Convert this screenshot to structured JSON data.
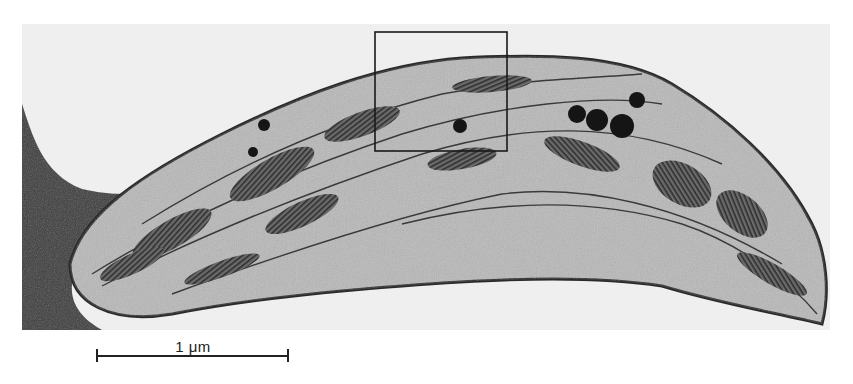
{
  "figure": {
    "inset_box": {
      "x": 375,
      "y": 32,
      "width": 132,
      "height": 119
    }
  },
  "scale_bar": {
    "label": "1 μm",
    "length_px": 192
  },
  "colors": {
    "background": "#ffffff",
    "field": "#efefef",
    "stroma": "#b8b8b8",
    "membrane": "#2a2a2a",
    "cytoplasm_dark": "#3a3a3a"
  }
}
